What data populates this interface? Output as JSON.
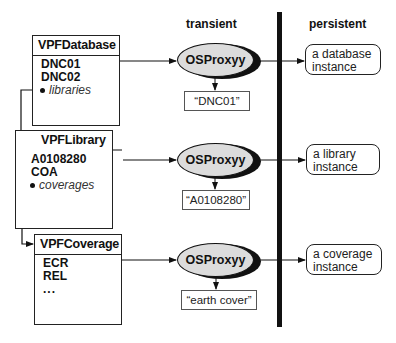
{
  "columns": {
    "transient": "transient",
    "persistent": "persistent"
  },
  "classes": [
    {
      "name": "VPFDatabase",
      "attributes": [
        "DNC01",
        "DNC02"
      ],
      "reference": "libraries"
    },
    {
      "name": "VPFLibrary",
      "attributes": [
        "A0108280",
        "COA"
      ],
      "reference": "coverages"
    },
    {
      "name": "VPFCoverage",
      "attributes": [
        "ECR",
        "REL"
      ],
      "ellipsis": "..."
    }
  ],
  "proxies": [
    {
      "label": "OSProxyy",
      "key": "“DNC01”",
      "instance": [
        "a database",
        "instance"
      ]
    },
    {
      "label": "OSProxyy",
      "key": "“A0108280”",
      "instance": [
        "a library",
        "instance"
      ]
    },
    {
      "label": "OSProxyy",
      "key": "“earth cover”",
      "instance": [
        "a coverage",
        "instance"
      ]
    }
  ],
  "colors": {
    "proxy_fill": "#dcdcdc",
    "line": "#111111",
    "divider": "#111111"
  }
}
